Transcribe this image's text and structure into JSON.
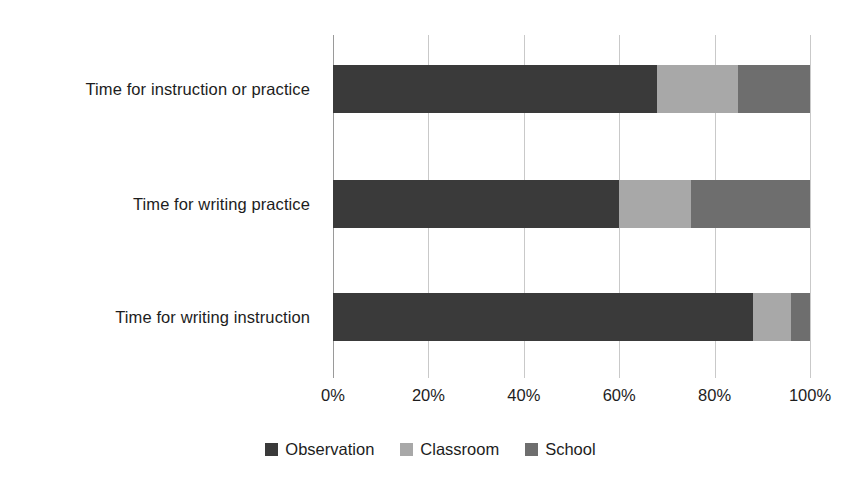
{
  "chart_data": {
    "type": "bar",
    "orientation": "horizontal",
    "stacked": true,
    "stack_total": 100,
    "title": "",
    "xlabel": "",
    "ylabel": "",
    "xlim": [
      0,
      100
    ],
    "xticks": [
      0,
      20,
      40,
      60,
      80,
      100
    ],
    "xtick_labels": [
      "0%",
      "20%",
      "40%",
      "60%",
      "80%",
      "100%"
    ],
    "grid": "vertical",
    "legend_position": "bottom-center",
    "categories": [
      "Time for instruction or practice",
      "Time for writing practice",
      "Time for writing instruction"
    ],
    "series": [
      {
        "name": "Observation",
        "color": "#3a3a3a",
        "values": [
          68,
          60,
          88
        ]
      },
      {
        "name": "Classroom",
        "color": "#a8a8a8",
        "values": [
          17,
          15,
          8
        ]
      },
      {
        "name": "School",
        "color": "#6e6e6e",
        "values": [
          15,
          25,
          4
        ]
      }
    ]
  },
  "axis": {
    "tick_labels": [
      "0%",
      "20%",
      "40%",
      "60%",
      "80%",
      "100%"
    ]
  },
  "legend": {
    "items": [
      {
        "label": "Observation",
        "color": "#3a3a3a"
      },
      {
        "label": "Classroom",
        "color": "#a8a8a8"
      },
      {
        "label": "School",
        "color": "#6e6e6e"
      }
    ]
  }
}
